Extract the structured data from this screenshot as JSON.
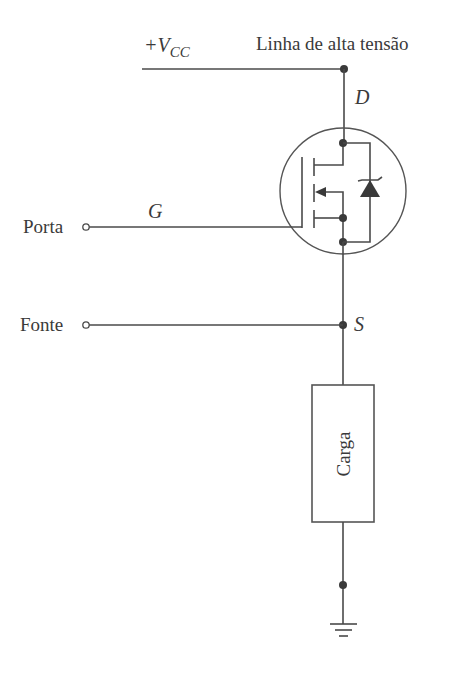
{
  "diagram": {
    "type": "circuit-schematic",
    "labels": {
      "supply": "+V",
      "supply_sub": "CC",
      "high_voltage_line": "Linha de alta tensão",
      "drain": "D",
      "gate": "G",
      "source": "S",
      "gate_terminal": "Porta",
      "source_terminal": "Fonte",
      "load": "Carga"
    },
    "components": [
      {
        "id": "mosfet",
        "kind": "n-channel enhancement MOSFET with body diode"
      },
      {
        "id": "load",
        "kind": "resistive load box",
        "label": "Carga"
      },
      {
        "id": "ground",
        "kind": "ground symbol"
      }
    ],
    "colors": {
      "line": "#4a4a4a",
      "text": "#3a3a3a",
      "background": "#ffffff"
    }
  }
}
